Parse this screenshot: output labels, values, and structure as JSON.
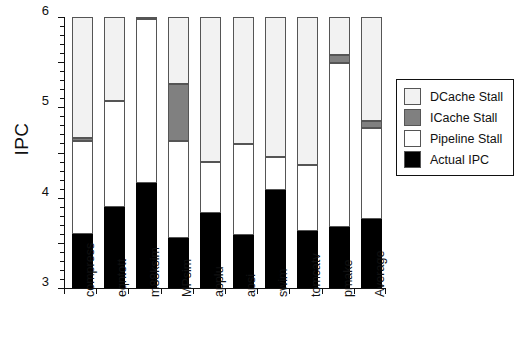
{
  "chart_data": {
    "type": "bar",
    "stacked": true,
    "title": "",
    "xlabel": "",
    "ylabel": "IPC",
    "ylim": [
      0,
      6
    ],
    "yticks": [
      0,
      1,
      2,
      3,
      4,
      5,
      6
    ],
    "ytick_labels": [
      "0",
      "1",
      "2",
      "3",
      "4",
      "5",
      "6"
    ],
    "minor_ticks_per_interval": 4,
    "grid": false,
    "legend_position": "right",
    "categories": [
      "compress",
      "eqntott",
      "m88ksim",
      "MPsim",
      "applu",
      "apsi",
      "swim",
      "tomcatv",
      "pmake",
      "Average"
    ],
    "series": [
      {
        "name": "Actual IPC",
        "color": "#000000",
        "values": [
          1.2,
          1.8,
          2.32,
          1.11,
          1.67,
          1.17,
          2.17,
          1.27,
          1.35,
          1.52
        ]
      },
      {
        "name": "Pipeline Stall",
        "color": "#ffffff",
        "values": [
          2.05,
          2.33,
          3.63,
          2.14,
          1.12,
          2.01,
          0.73,
          1.45,
          3.63,
          2.03
        ]
      },
      {
        "name": "ICache Stall",
        "color": "#808080",
        "values": [
          0.08,
          0.0,
          0.05,
          1.27,
          0.0,
          0.0,
          0.0,
          0.0,
          0.17,
          0.15
        ]
      },
      {
        "name": "DCache Stall",
        "color": "#f2f2f2",
        "values": [
          2.67,
          1.87,
          0.0,
          1.48,
          3.21,
          2.82,
          3.1,
          3.28,
          0.85,
          2.3
        ]
      }
    ],
    "cumulative_tops": [
      {
        "category": "compress",
        "actual": 1.2,
        "pipeline": 3.25,
        "icache": 3.33,
        "dcache": 6.0
      },
      {
        "category": "eqntott",
        "actual": 1.8,
        "pipeline": 4.13,
        "icache": 4.13,
        "dcache": 6.0
      },
      {
        "category": "m88ksim",
        "actual": 2.32,
        "pipeline": 5.95,
        "icache": 6.0,
        "dcache": 6.0
      },
      {
        "category": "MPsim",
        "actual": 1.11,
        "pipeline": 3.25,
        "icache": 4.52,
        "dcache": 6.0
      },
      {
        "category": "applu",
        "actual": 1.67,
        "pipeline": 2.79,
        "icache": 2.79,
        "dcache": 6.0
      },
      {
        "category": "apsi",
        "actual": 1.17,
        "pipeline": 3.18,
        "icache": 3.18,
        "dcache": 6.0
      },
      {
        "category": "swim",
        "actual": 2.17,
        "pipeline": 2.9,
        "icache": 2.9,
        "dcache": 6.0
      },
      {
        "category": "tomcatv",
        "actual": 1.27,
        "pipeline": 2.72,
        "icache": 2.72,
        "dcache": 6.0
      },
      {
        "category": "pmake",
        "actual": 1.35,
        "pipeline": 4.98,
        "icache": 5.15,
        "dcache": 6.0
      },
      {
        "category": "Average",
        "actual": 1.52,
        "pipeline": 3.55,
        "icache": 3.7,
        "dcache": 6.0
      }
    ]
  },
  "axis": {
    "ylabel": "IPC",
    "ytick_labels": [
      "6",
      "5",
      "4",
      "3",
      "2",
      "1",
      "0"
    ]
  },
  "legend": {
    "items": [
      {
        "label": "DCache Stall",
        "color": "#f2f2f2",
        "swatch": "dcache-swatch"
      },
      {
        "label": "ICache Stall",
        "color": "#808080",
        "swatch": "icache-swatch"
      },
      {
        "label": "Pipeline Stall",
        "color": "#ffffff",
        "swatch": "pipeline-swatch"
      },
      {
        "label": "Actual IPC",
        "color": "#000000",
        "swatch": "actual-swatch"
      }
    ]
  },
  "footer": {
    "artifact_text": ""
  }
}
